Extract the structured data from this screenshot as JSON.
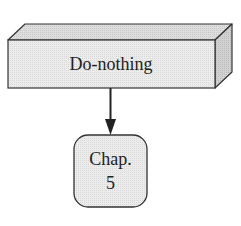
{
  "diagram": {
    "nodes": [
      {
        "id": "do-nothing",
        "shape": "3d-box",
        "label": "Do-nothing"
      },
      {
        "id": "chap-5",
        "shape": "rounded-rect",
        "label_lines": [
          "Chap.",
          "5"
        ]
      }
    ],
    "edges": [
      {
        "from": "do-nothing",
        "to": "chap-5",
        "style": "arrow"
      }
    ],
    "colors": {
      "fill_front": "#e6e6e6",
      "fill_top": "#d4d4d4",
      "fill_side": "#c4c4c4",
      "fill_node": "#ececec",
      "stroke": "#333333"
    }
  }
}
